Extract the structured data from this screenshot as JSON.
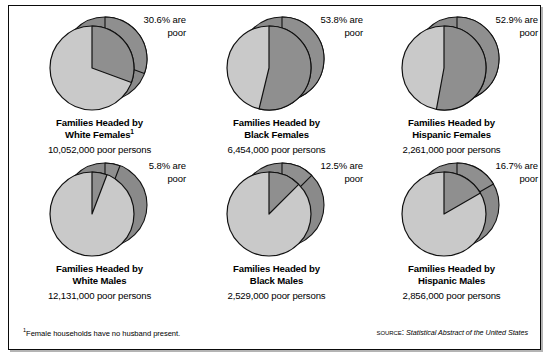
{
  "figure": {
    "footnote_marker": "1",
    "footnote": "Female households have no husband present.",
    "source_label": "Source:",
    "source_title": "Statistical Abstract of the United States"
  },
  "colors": {
    "pie_light": "#c9c9c9",
    "pie_dark": "#8f8f8f",
    "rim_dark": "#8a8a8a",
    "outline": "#111111",
    "panel_border": "#0a0a0a",
    "background": "#ffffff"
  },
  "chart_data": {
    "type": "pie",
    "title": "",
    "legend_position": "none",
    "charts": [
      {
        "id": "white-females",
        "title_line1": "Families Headed by",
        "title_line2": "White Females",
        "title_footnote_marker": "1",
        "count": "10,052,000 poor persons",
        "count_value": 10052000,
        "callout_line1": "30.6% are",
        "callout_line2": "poor",
        "categories": [
          "poor",
          "not poor"
        ],
        "values": [
          30.6,
          69.4
        ]
      },
      {
        "id": "black-females",
        "title_line1": "Families Headed by",
        "title_line2": "Black Females",
        "title_footnote_marker": "",
        "count": "6,454,000 poor persons",
        "count_value": 6454000,
        "callout_line1": "53.8% are",
        "callout_line2": "poor",
        "categories": [
          "poor",
          "not poor"
        ],
        "values": [
          53.8,
          46.2
        ]
      },
      {
        "id": "hispanic-females",
        "title_line1": "Families Headed by",
        "title_line2": "Hispanic Females",
        "title_footnote_marker": "",
        "count": "2,261,000 poor persons",
        "count_value": 2261000,
        "callout_line1": "52.9% are",
        "callout_line2": "poor",
        "categories": [
          "poor",
          "not poor"
        ],
        "values": [
          52.9,
          47.1
        ]
      },
      {
        "id": "white-males",
        "title_line1": "Families Headed by",
        "title_line2": "White Males",
        "title_footnote_marker": "",
        "count": "12,131,000 poor persons",
        "count_value": 12131000,
        "callout_line1": "5.8% are",
        "callout_line2": "poor",
        "categories": [
          "poor",
          "not poor"
        ],
        "values": [
          5.8,
          94.2
        ]
      },
      {
        "id": "black-males",
        "title_line1": "Families Headed by",
        "title_line2": "Black Males",
        "title_footnote_marker": "",
        "count": "2,529,000 poor persons",
        "count_value": 2529000,
        "callout_line1": "12.5% are",
        "callout_line2": "poor",
        "categories": [
          "poor",
          "not poor"
        ],
        "values": [
          12.5,
          87.5
        ]
      },
      {
        "id": "hispanic-males",
        "title_line1": "Families Headed by",
        "title_line2": "Hispanic Males",
        "title_footnote_marker": "",
        "count": "2,856,000 poor persons",
        "count_value": 2856000,
        "callout_line1": "16.7% are",
        "callout_line2": "poor",
        "categories": [
          "poor",
          "not poor"
        ],
        "values": [
          16.7,
          83.3
        ]
      }
    ]
  }
}
